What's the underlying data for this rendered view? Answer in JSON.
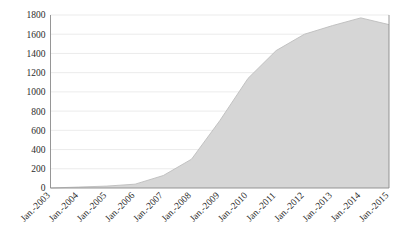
{
  "chart_data": {
    "type": "area",
    "title": "",
    "subtitle": "",
    "xlabel": "",
    "ylabel": "",
    "categories": [
      "Jan.-2003",
      "Jan.-2004",
      "Jan.-2005",
      "Jan.-2006",
      "Jan.-2007",
      "Jan.-2008",
      "Jan.-2009",
      "Jan.-2010",
      "Jan.-2011",
      "Jan.-2012",
      "Jan.-2013",
      "Jan.-2014",
      "Jan.-2015"
    ],
    "values": [
      0,
      10,
      20,
      40,
      130,
      300,
      700,
      1140,
      1430,
      1600,
      1690,
      1770,
      1700
    ],
    "ylim": [
      0,
      1800
    ],
    "yticks": [
      0,
      200,
      400,
      600,
      800,
      1000,
      1200,
      1400,
      1600,
      1800
    ],
    "ytick_labels": [
      "0",
      "200",
      "400",
      "600",
      "800",
      "1000",
      "1200",
      "1400",
      "1600",
      "1800"
    ],
    "grid": true,
    "legend": false,
    "legend_position": "none",
    "series": [
      {
        "name": "series-1",
        "values": [
          0,
          10,
          20,
          40,
          130,
          300,
          700,
          1140,
          1430,
          1600,
          1690,
          1770,
          1700
        ]
      }
    ],
    "colors": {
      "area_fill": "#d6d6d6",
      "area_stroke": "#bdbdbd",
      "gridline": "#e6e6e6",
      "axis": "#8a8a8a",
      "tick_text": "#2b2b2b",
      "background": "#ffffff"
    }
  }
}
